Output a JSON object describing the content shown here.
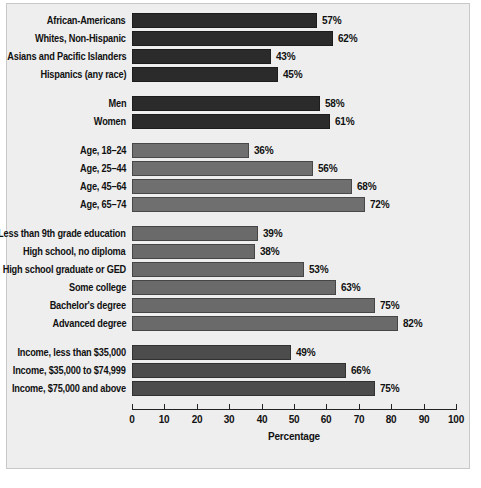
{
  "chart_data": {
    "type": "bar",
    "orientation": "horizontal",
    "title": "",
    "xlabel": "Percentage",
    "ylabel": "",
    "xlim": [
      0,
      100
    ],
    "xticks": [
      "0",
      "10",
      "20",
      "30",
      "40",
      "50",
      "60",
      "70",
      "80",
      "90",
      "100"
    ],
    "grid": false,
    "legend": "none",
    "value_label_suffix": "%",
    "groups": [
      {
        "name": "race-ethnicity",
        "color": "#2b2b2b",
        "categories": [
          "African-Americans",
          "Whites, Non-Hispanic",
          "Asians and Pacific Islanders",
          "Hispanics (any race)"
        ],
        "values": [
          57,
          62,
          43,
          45
        ],
        "value_labels": [
          "57%",
          "62%",
          "43%",
          "45%"
        ]
      },
      {
        "name": "gender",
        "color": "#2b2b2b",
        "categories": [
          "Men",
          "Women"
        ],
        "values": [
          58,
          61
        ],
        "value_labels": [
          "58%",
          "61%"
        ]
      },
      {
        "name": "age",
        "color": "#6f6f6f",
        "categories": [
          "Age, 18–24",
          "Age, 25–44",
          "Age, 45–64",
          "Age, 65–74"
        ],
        "values": [
          36,
          56,
          68,
          72
        ],
        "value_labels": [
          "36%",
          "56%",
          "68%",
          "72%"
        ]
      },
      {
        "name": "education",
        "color": "#6a6a6a",
        "categories": [
          "Less than 9th grade education",
          "High school, no diploma",
          "High school graduate or GED",
          "Some college",
          "Bachelor's degree",
          "Advanced degree"
        ],
        "values": [
          39,
          38,
          53,
          63,
          75,
          82
        ],
        "value_labels": [
          "39%",
          "38%",
          "53%",
          "63%",
          "75%",
          "82%"
        ]
      },
      {
        "name": "income",
        "color": "#4c4c4c",
        "categories": [
          "Income, less than $35,000",
          "Income, $35,000 to $74,999",
          "Income, $75,000 and above"
        ],
        "values": [
          49,
          66,
          75
        ],
        "value_labels": [
          "49%",
          "66%",
          "75%"
        ]
      }
    ]
  }
}
